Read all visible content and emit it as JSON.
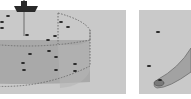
{
  "figure": {
    "panels": [
      {
        "id": "a",
        "description": "Research vessel above a cylindrical water-column sampling volume with scattered fish targets",
        "icons": [
          "ship-icon",
          "transducer-beam-line",
          "cylinder-volume",
          "fish-target-dots"
        ],
        "fish_targets_count": 16
      },
      {
        "id": "b",
        "description": "Close-up of curved acoustic beam cone with fish targets",
        "icons": [
          "beam-cone",
          "fish-target-dots"
        ],
        "fish_targets_count": 3
      }
    ],
    "colors": {
      "background": "#c9c9c9",
      "cylinder_fill": "#a9a9a9",
      "outline": "#6e6e6e",
      "ship": "#2a2a2a",
      "fish": "#222222",
      "gap": "#ffffff"
    }
  }
}
